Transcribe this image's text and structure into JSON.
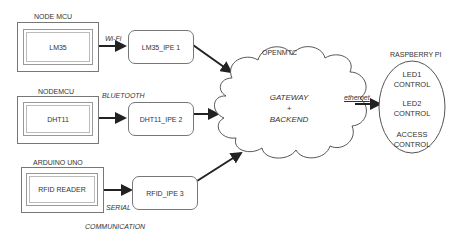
{
  "nodes": [
    {
      "board": "NODE MCU",
      "sensor": "LM35",
      "ipe": "LM35_IPE 1",
      "link": "Wi-Fi"
    },
    {
      "board": "NODEMCU",
      "sensor": "DHT11",
      "ipe": "DHT11_IPE 2",
      "link": "BLUETOOTH"
    },
    {
      "board": "ARDUINO UNO",
      "sensor": "RFID READER",
      "ipe": "RFID_IPE 3",
      "link": "SERIAL",
      "link_extra": "COMMUNICATION"
    }
  ],
  "cloud": {
    "title": "OPENMTC",
    "line1": "GATEWAY",
    "line2": "+",
    "line3": "BACKEND"
  },
  "link_to_pi": "ethernet",
  "pi": {
    "title": "RASPBERRY PI",
    "items": [
      {
        "l1": "LED1",
        "l2": "CONTROL"
      },
      {
        "l1": "LED2",
        "l2": "CONTROL"
      },
      {
        "l1": "ACCESS",
        "l2": "CONTROL"
      }
    ]
  },
  "colors": {
    "line": "#222222",
    "border": "#777777"
  }
}
